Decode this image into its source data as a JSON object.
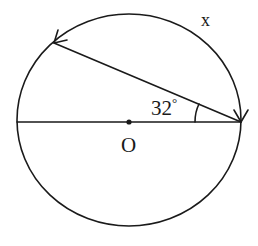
{
  "diagram": {
    "type": "circle-geometry",
    "center_label": "O",
    "angle_label": "32°",
    "angle_value": "32",
    "angle_unit": "°",
    "arc_label": "x",
    "colors": {
      "line": "#1a1a1a",
      "background": "#ffffff"
    }
  }
}
